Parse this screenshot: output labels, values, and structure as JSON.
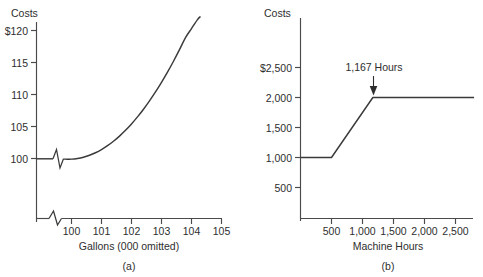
{
  "figure": {
    "background_color": "#ffffff",
    "line_color": "#3a3a3a",
    "axis_color": "#4a4a4a",
    "text_color": "#2e2e2e"
  },
  "chart_data": [
    {
      "type": "line",
      "panel_label": "(a)",
      "title": "",
      "ylabel": "Costs",
      "xlabel": "Gallons (000 omitted)",
      "x_tick_labels": [
        "100",
        "101",
        "102",
        "103",
        "104",
        "105"
      ],
      "x_tick_values": [
        100,
        101,
        102,
        103,
        104,
        105
      ],
      "y_tick_labels": [
        "100",
        "105",
        "110",
        "115",
        "$120"
      ],
      "y_tick_values": [
        100,
        105,
        110,
        115,
        120
      ],
      "xlim": [
        99.4,
        105.3
      ],
      "ylim": [
        97.0,
        122.5
      ],
      "grid": false,
      "legend": "none",
      "axis_break_x": true,
      "axis_break_curve": true,
      "series": [
        {
          "name": "Total cost curve",
          "x": [
            99.45,
            99.62,
            99.8,
            100.0,
            100.2,
            100.4,
            100.6,
            100.8,
            101.0,
            101.2,
            101.4,
            101.6,
            101.8,
            102.0,
            102.2,
            102.4,
            102.6,
            102.8,
            103.0,
            103.2,
            103.4,
            103.6,
            103.8,
            104.0,
            104.2,
            104.3
          ],
          "y": [
            99.9,
            99.9,
            99.9,
            99.9,
            100.0,
            100.2,
            100.5,
            100.9,
            101.4,
            102.0,
            102.7,
            103.5,
            104.4,
            105.4,
            106.5,
            107.7,
            109.0,
            110.4,
            111.9,
            113.5,
            115.2,
            117.0,
            118.9,
            120.3,
            121.7,
            122.2
          ]
        }
      ]
    },
    {
      "type": "line",
      "panel_label": "(b)",
      "title": "",
      "ylabel": "Costs",
      "xlabel": "Machine Hours",
      "x_tick_labels": [
        "500",
        "1,000",
        "1,500",
        "2,000",
        "2,500"
      ],
      "x_tick_values": [
        500,
        1000,
        1500,
        2000,
        2500
      ],
      "y_tick_labels": [
        "500",
        "1,000",
        "1,500",
        "2,000",
        "$2,500"
      ],
      "y_tick_values": [
        500,
        1000,
        1500,
        2000,
        2500
      ],
      "xlim": [
        0,
        2800
      ],
      "ylim": [
        0,
        2750
      ],
      "grid": false,
      "legend": "none",
      "annotations": [
        {
          "text": "1,167 Hours",
          "x": 1167,
          "y": 2000,
          "marker": "down-arrow"
        }
      ],
      "series": [
        {
          "name": "Step cost line",
          "x": [
            0,
            500,
            1167,
            2800
          ],
          "y": [
            1000,
            1000,
            2000,
            2000
          ]
        }
      ]
    }
  ]
}
